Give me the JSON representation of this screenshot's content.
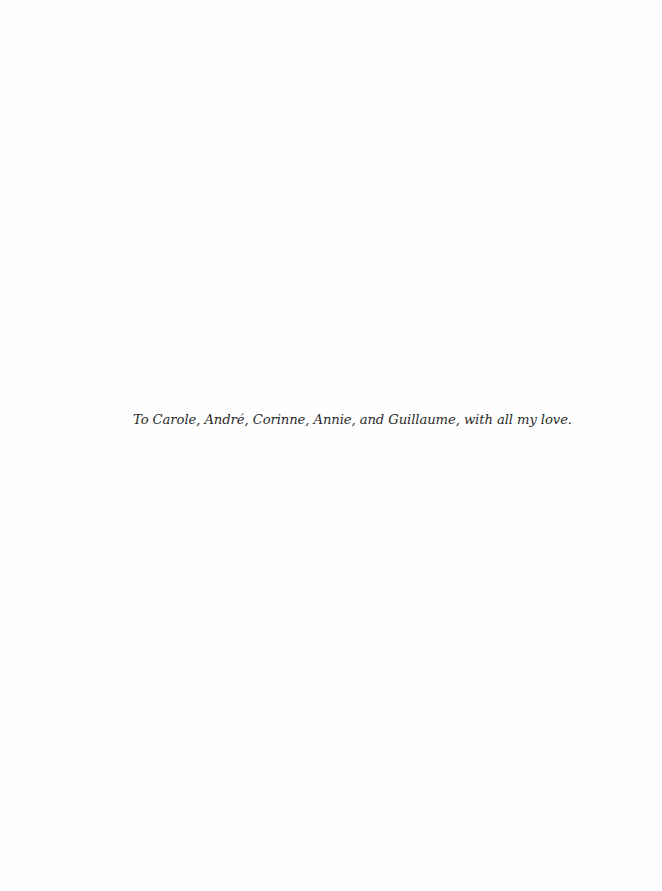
{
  "page": {
    "type": "dedication",
    "dedication_text": "To Carole, André, Corinne, Annie, and Guillaume, with all my love."
  }
}
